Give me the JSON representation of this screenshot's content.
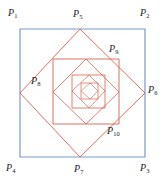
{
  "figure": {
    "canvas": {
      "width": 165,
      "height": 189
    },
    "background_color": "#ffffff",
    "outer_square_color": "#7b9bc4",
    "inscribed_square_color": "#d9604f",
    "label_color": "#23201e"
  },
  "labels": {
    "p1": {
      "base": "P",
      "sub": "1",
      "x": 8,
      "y": 8
    },
    "p2": {
      "base": "P",
      "sub": "2",
      "x": 140,
      "y": 8
    },
    "p3": {
      "base": "P",
      "sub": "3",
      "x": 140,
      "y": 163
    },
    "p4": {
      "base": "P",
      "sub": "4",
      "x": 6,
      "y": 163
    },
    "p5": {
      "base": "P",
      "sub": "5",
      "x": 73,
      "y": 9
    },
    "p6": {
      "base": "P",
      "sub": "6",
      "x": 148,
      "y": 85
    },
    "p7": {
      "base": "P",
      "sub": "7",
      "x": 74,
      "y": 164
    },
    "p8": {
      "base": "P",
      "sub": "8",
      "x": 31,
      "y": 76
    },
    "p9": {
      "base": "P",
      "sub": "9",
      "x": 109,
      "y": 44
    },
    "p10": {
      "base": "P",
      "sub": "10",
      "x": 107,
      "y": 126
    }
  },
  "chart_data": {
    "type": "diagram",
    "squares": [
      {
        "name": "outer-square",
        "color": "#7b9bc4",
        "stroke_width": 1.2,
        "vertices": [
          {
            "label": "P1",
            "x": 20,
            "y": 29
          },
          {
            "label": "P2",
            "x": 145,
            "y": 29
          },
          {
            "label": "P3",
            "x": 145,
            "y": 157
          },
          {
            "label": "P4",
            "x": 20,
            "y": 157
          }
        ]
      },
      {
        "name": "square-2",
        "color": "#d9604f",
        "stroke_width": 0.9,
        "vertices": [
          {
            "label": "P5",
            "x": 80,
            "y": 29
          },
          {
            "label": "P6",
            "x": 145,
            "y": 93
          },
          {
            "label": "P7",
            "x": 80,
            "y": 157
          },
          {
            "label": "P8",
            "x": 20,
            "y": 93
          }
        ]
      },
      {
        "name": "square-3",
        "color": "#d9604f",
        "stroke_width": 0.9,
        "vertices": [
          {
            "label": "P9",
            "x": 119,
            "y": 59
          },
          {
            "label": "P10",
            "x": 119,
            "y": 124
          },
          {
            "label": "",
            "x": 53,
            "y": 124
          },
          {
            "label": "",
            "x": 53,
            "y": 59
          }
        ]
      },
      {
        "name": "square-4",
        "color": "#d9604f",
        "stroke_width": 0.8,
        "vertices": [
          {
            "label": "",
            "x": 86,
            "y": 59
          },
          {
            "label": "",
            "x": 119,
            "y": 92
          },
          {
            "label": "",
            "x": 86,
            "y": 124
          },
          {
            "label": "",
            "x": 53,
            "y": 92
          }
        ]
      },
      {
        "name": "square-5",
        "color": "#d9604f",
        "stroke_width": 0.8,
        "vertices": [
          {
            "label": "",
            "x": 105,
            "y": 75
          },
          {
            "label": "",
            "x": 105,
            "y": 108
          },
          {
            "label": "",
            "x": 72,
            "y": 108
          },
          {
            "label": "",
            "x": 72,
            "y": 75
          }
        ]
      },
      {
        "name": "square-6",
        "color": "#d9604f",
        "stroke_width": 0.7,
        "vertices": [
          {
            "label": "",
            "x": 89,
            "y": 75
          },
          {
            "label": "",
            "x": 105,
            "y": 91
          },
          {
            "label": "",
            "x": 89,
            "y": 108
          },
          {
            "label": "",
            "x": 72,
            "y": 91
          }
        ]
      },
      {
        "name": "square-7",
        "color": "#d9604f",
        "stroke_width": 0.7,
        "vertices": [
          {
            "label": "",
            "x": 98,
            "y": 83
          },
          {
            "label": "",
            "x": 98,
            "y": 99
          },
          {
            "label": "",
            "x": 81,
            "y": 99
          },
          {
            "label": "",
            "x": 81,
            "y": 83
          }
        ]
      },
      {
        "name": "square-8",
        "color": "#d9604f",
        "stroke_width": 0.6,
        "vertices": [
          {
            "label": "",
            "x": 90,
            "y": 83
          },
          {
            "label": "",
            "x": 98,
            "y": 91
          },
          {
            "label": "",
            "x": 90,
            "y": 99
          },
          {
            "label": "",
            "x": 81,
            "y": 91
          }
        ]
      }
    ]
  }
}
